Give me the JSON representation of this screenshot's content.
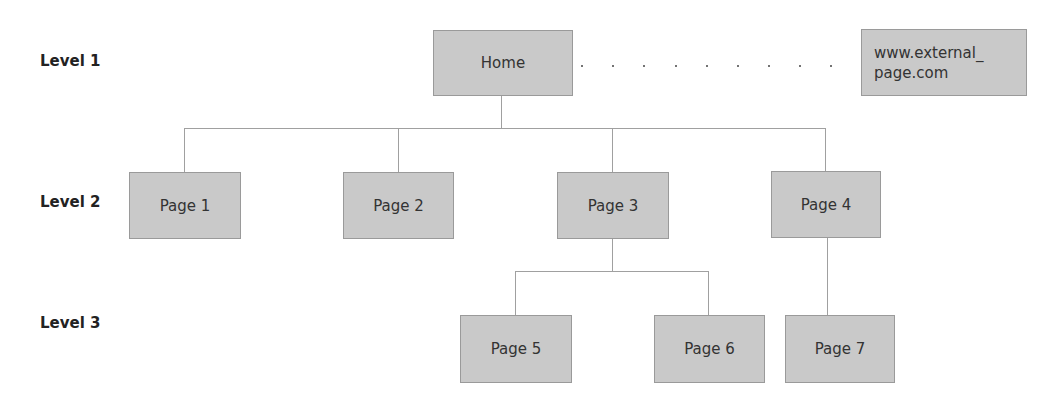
{
  "levels": [
    {
      "label": "Level 1"
    },
    {
      "label": "Level 2"
    },
    {
      "label": "Level 3"
    }
  ],
  "nodes": {
    "home": "Home",
    "external": "www.external_\npage.com",
    "external_line1": "www.external_",
    "external_line2": "page.com",
    "page1": "Page 1",
    "page2": "Page 2",
    "page3": "Page 3",
    "page4": "Page 4",
    "page5": "Page 5",
    "page6": "Page 6",
    "page7": "Page 7"
  },
  "colors": {
    "node_fill": "#c9c9c9",
    "node_border": "#9a9a9a",
    "connector": "#a0a0a0"
  }
}
